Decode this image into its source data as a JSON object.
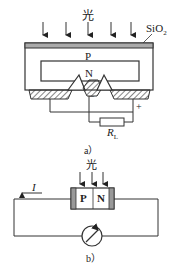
{
  "figure_a": {
    "light_label": "光",
    "oxide_label": "SiO",
    "oxide_sub": "2",
    "p_label": "P",
    "n_label": "N",
    "minus_label": "−",
    "plus_label": "+",
    "resistor_label": "R",
    "resistor_sub": "L",
    "caption": "a）"
  },
  "figure_b": {
    "light_label": "光",
    "p_label": "P",
    "n_label": "N",
    "current_label": "I",
    "caption": "b）"
  }
}
